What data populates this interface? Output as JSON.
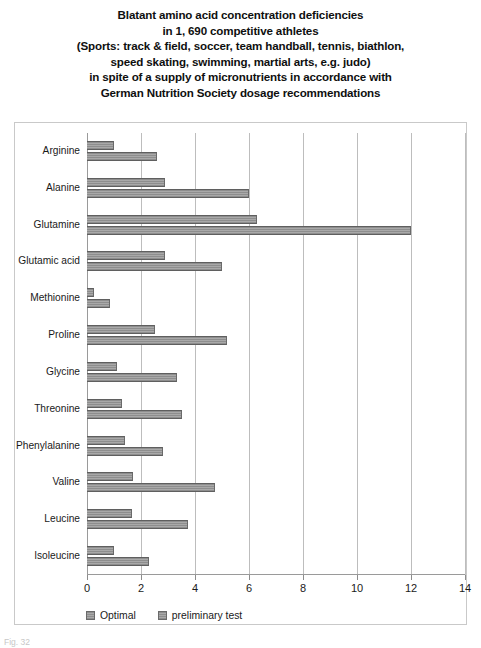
{
  "figure": {
    "title_lines": [
      "Blatant amino acid concentration deficiencies",
      "in 1, 690 competitive athletes",
      "(Sports: track & field, soccer, team handball, tennis, biathlon,",
      "speed skating, swimming, martial arts, e.g. judo)",
      "in spite of a supply of micronutrients in accordance with",
      "German Nutrition Society dosage recommendations"
    ],
    "caption": "Fig. 32",
    "bar_color": "#9a9a9a",
    "grid_color": "#bdbdbd",
    "frame_color": "#c9c9c9"
  },
  "chart_data": {
    "type": "bar",
    "orientation": "horizontal",
    "xlabel": "",
    "ylabel": "",
    "xlim": [
      0,
      14
    ],
    "ylim": null,
    "xticks": [
      0,
      2,
      4,
      6,
      8,
      10,
      12,
      14
    ],
    "xtick_labels": [
      "0",
      "2",
      "4",
      "6",
      "8",
      "10",
      "12",
      "14"
    ],
    "grid": "vertical",
    "legend_position": "bottom-left",
    "categories": [
      "Arginine",
      "Alanine",
      "Glutamine",
      "Glutamic acid",
      "Methionine",
      "Proline",
      "Glycine",
      "Threonine",
      "Phenylalanine",
      "Valine",
      "Leucine",
      "Isoleucine"
    ],
    "series": [
      {
        "name": "Optimal",
        "values": [
          1.0,
          2.9,
          6.3,
          2.9,
          0.25,
          2.5,
          1.1,
          1.3,
          1.4,
          1.7,
          1.65,
          1.0
        ]
      },
      {
        "name": "preliminary test",
        "values": [
          2.6,
          6.0,
          12.0,
          5.0,
          0.85,
          5.2,
          3.35,
          3.5,
          2.8,
          4.75,
          3.75,
          2.3
        ]
      }
    ]
  }
}
